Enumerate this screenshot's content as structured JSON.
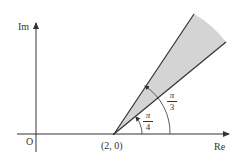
{
  "diagram": {
    "type": "complex-plane-sector",
    "axes": {
      "real_label": "Re",
      "imaginary_label": "Im",
      "origin_label": "O"
    },
    "vertex": {
      "label": "(2, 0)",
      "re": 2,
      "im": 0
    },
    "angles": [
      {
        "name": "lower-ray",
        "numerator": "π",
        "denominator": "4"
      },
      {
        "name": "upper-ray",
        "numerator": "π",
        "denominator": "3"
      }
    ],
    "region": {
      "description": "shaded sector between arg(z-2)=π/4 and arg(z-2)=π/3",
      "fill": "#d4d4d4"
    },
    "colors": {
      "line": "#333333",
      "shade": "#d4d4d4"
    }
  }
}
